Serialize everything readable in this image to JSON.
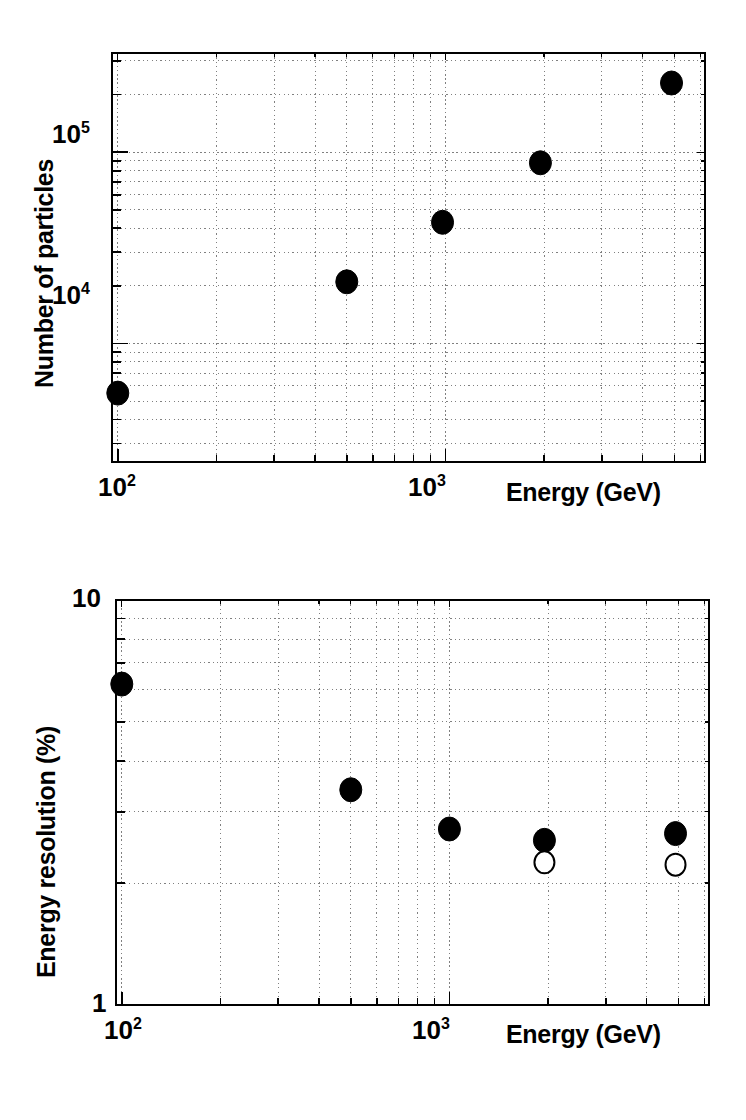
{
  "figure": {
    "background": "#ffffff",
    "ink_color": "#000000",
    "grid_color": "#808080",
    "panels": 2
  },
  "chart_data": [
    {
      "id": "number-of-particles",
      "type": "scatter",
      "title": "",
      "xlabel": "Energy (GeV)",
      "ylabel": "Number of particles",
      "xscale": "log",
      "yscale": "log",
      "xlim": [
        96,
        6200
      ],
      "ylim": [
        2400,
        330000
      ],
      "grid": true,
      "grid_style": "dotted",
      "legend": "none",
      "xtick_labels": [
        "10²",
        "10³"
      ],
      "xtick_values": [
        100,
        1000
      ],
      "ytick_labels": [
        "10⁴",
        "10⁵"
      ],
      "ytick_values": [
        10000,
        100000
      ],
      "series": [
        {
          "name": "Number of particles",
          "marker": "filled-circle",
          "marker_color": "#000000",
          "x": [
            100,
            500,
            980,
            1950,
            4900
          ],
          "y": [
            5500,
            21000,
            43000,
            88000,
            230000
          ]
        }
      ]
    },
    {
      "id": "energy-resolution",
      "type": "scatter",
      "title": "",
      "xlabel": "Energy (GeV)",
      "ylabel": "Energy resolution (%)",
      "xscale": "log",
      "yscale": "log",
      "xlim": [
        96,
        6200
      ],
      "ylim": [
        1,
        10
      ],
      "grid": true,
      "grid_style": "dotted",
      "legend": "none",
      "xtick_labels": [
        "10²",
        "10³"
      ],
      "xtick_values": [
        100,
        1000
      ],
      "ytick_labels": [
        "1",
        "10"
      ],
      "ytick_values": [
        1,
        10
      ],
      "series": [
        {
          "name": "measured resolution",
          "marker": "filled-circle",
          "marker_color": "#000000",
          "x": [
            100,
            500,
            1000,
            1950,
            4900
          ],
          "y": [
            6.2,
            3.4,
            2.72,
            2.55,
            2.65
          ]
        },
        {
          "name": "corrected resolution",
          "marker": "open-circle",
          "marker_color": "#000000",
          "x": [
            1950,
            4900
          ],
          "y": [
            2.25,
            2.22
          ]
        }
      ]
    }
  ],
  "top_panel": {
    "ylabel": "Number of particles",
    "xlabel": "Energy (GeV)",
    "xtick_1_mantissa": "10",
    "xtick_1_exponent": "2",
    "xtick_2_mantissa": "10",
    "xtick_2_exponent": "3",
    "ytick_1_mantissa": "10",
    "ytick_1_exponent": "5",
    "ytick_2_mantissa": "10",
    "ytick_2_exponent": "4"
  },
  "bottom_panel": {
    "ylabel": "Energy resolution (%)",
    "xlabel": "Energy (GeV)",
    "xtick_1_mantissa": "10",
    "xtick_1_exponent": "2",
    "xtick_2_mantissa": "10",
    "xtick_2_exponent": "3",
    "ytick_top": "10",
    "ytick_bottom": "1"
  }
}
